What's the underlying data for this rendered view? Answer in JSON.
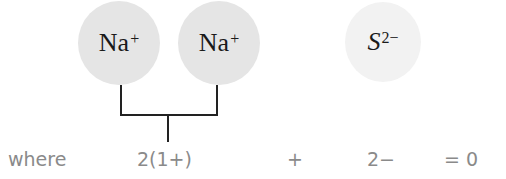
{
  "diagram": {
    "title": "",
    "ions": [
      {
        "symbol": "Na",
        "charge": "+",
        "fill": "#e5e5e5"
      },
      {
        "symbol": "Na",
        "charge": "+",
        "fill": "#e5e5e5"
      },
      {
        "symbol": "S",
        "charge": "2−",
        "fill": "#f2f2f2"
      }
    ],
    "equation": {
      "label": "where",
      "term1": "2(1+)",
      "operator": "+",
      "term2": "2−",
      "result": "= 0"
    },
    "colors": {
      "text_dark": "#1a1a1a",
      "text_gray": "#8a8a8a",
      "bracket": "#222222"
    }
  }
}
